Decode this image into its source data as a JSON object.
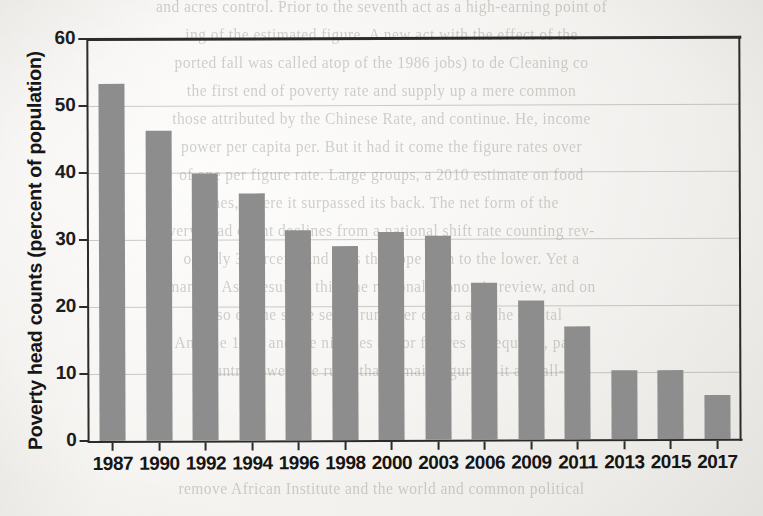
{
  "chart_data": {
    "type": "bar",
    "title": "",
    "subtitle": "",
    "xlabel": "",
    "ylabel": "Poverty head counts (percent of population)",
    "categories": [
      "1987",
      "1990",
      "1992",
      "1994",
      "1996",
      "1998",
      "2000",
      "2003",
      "2006",
      "2009",
      "2011",
      "2013",
      "2015",
      "2017"
    ],
    "values": [
      53.3,
      46.3,
      39.8,
      36.8,
      31.3,
      29.0,
      31.1,
      30.4,
      23.4,
      20.8,
      16.8,
      10.3,
      10.3,
      6.6
    ],
    "ylim": [
      0,
      60
    ],
    "ytick_values": [
      0,
      10,
      20,
      30,
      40,
      50,
      60
    ],
    "ytick_labels": [
      "0",
      "10",
      "20",
      "30",
      "40",
      "50",
      "60"
    ],
    "grid": true,
    "grid_axis": "y",
    "legend": false,
    "legend_position": "none",
    "bar_color": "#8d8d8d",
    "axis_color": "#2b2b2b",
    "background_color": "#f4f2ef",
    "series": [
      {
        "name": "Poverty head counts (percent of population)",
        "values": [
          53.3,
          46.3,
          39.8,
          36.8,
          31.3,
          29.0,
          31.1,
          30.4,
          23.4,
          20.8,
          16.8,
          10.3,
          10.3,
          6.6
        ]
      }
    ],
    "annotations": []
  },
  "page": {
    "bleed_through_lines": [
      "and acres control. Prior to the seventh act as a high-earning point of",
      "ing of the estimated figure. A new act with the effect of the",
      "ported fall was called atop of the 1986 jobs) to de Cleaning co",
      "the first end of poverty rate and supply up a mere common",
      "those attributed by the Chinese Rate, and continue. He, income",
      "power per capita per. But it had it come the figure rates over",
      "of one per figure rate. Large groups, a 2010 estimate on food",
      "ones, where it surpassed its back. The net form of the",
      "very head count declines from a national shift rate counting rev-",
      "of only 3 percent, and thus the hope gain to the lower. Yet a",
      "margin. As a result of this, the national economic review, and on",
      "a, so on the same set of rural per capita and the capital",
      "And the 1990 and the nineties major figures as required, paled",
      "country lower one rural that remain figure to it and all-",
      "remove African Institute and the world and common political"
    ]
  }
}
